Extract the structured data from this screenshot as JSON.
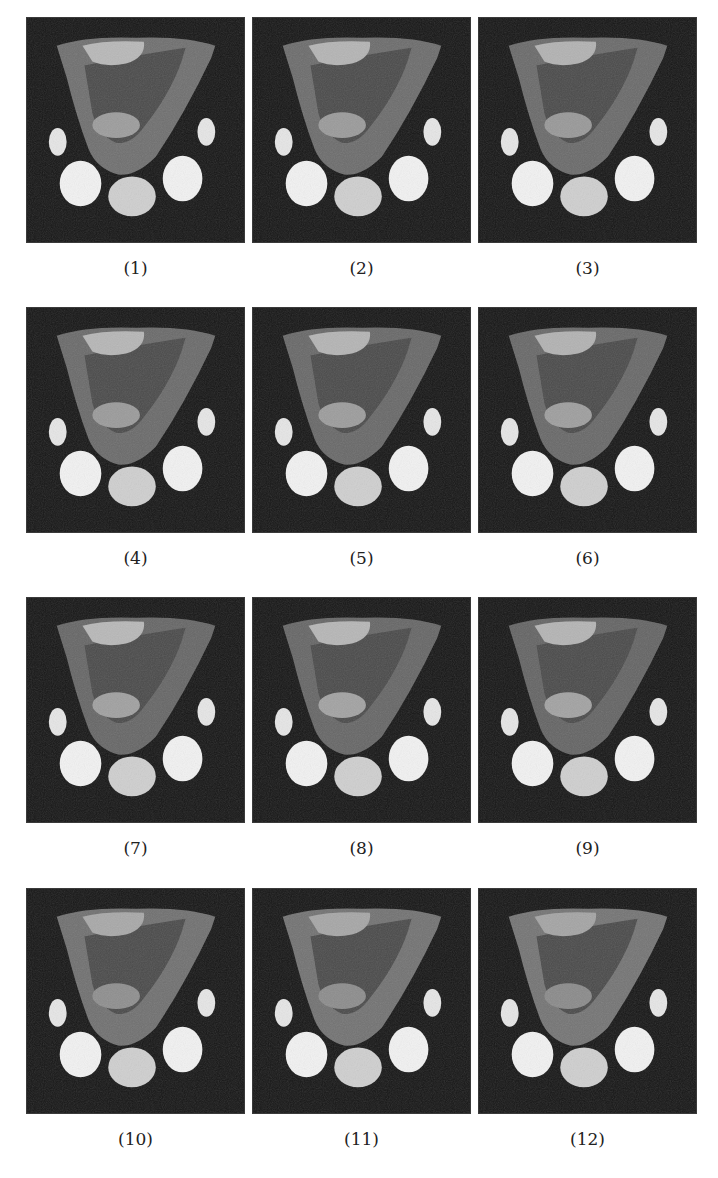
{
  "figure": {
    "layout": {
      "columns": 3,
      "rows": 4
    },
    "panels": [
      {
        "label": "(1)",
        "tissue_tone": "#6f6f6f",
        "upper_tone": "#b8b8b8",
        "lower_tone": "#9c9c9c"
      },
      {
        "label": "(2)",
        "tissue_tone": "#6c6c6c",
        "upper_tone": "#b4b4b4",
        "lower_tone": "#9a9a9a"
      },
      {
        "label": "(3)",
        "tissue_tone": "#6a6a6a",
        "upper_tone": "#b2b2b2",
        "lower_tone": "#989898"
      },
      {
        "label": "(4)",
        "tissue_tone": "#6a6a6a",
        "upper_tone": "#b6b6b6",
        "lower_tone": "#9a9a9a"
      },
      {
        "label": "(5)",
        "tissue_tone": "#686868",
        "upper_tone": "#b4b4b4",
        "lower_tone": "#9c9c9c"
      },
      {
        "label": "(6)",
        "tissue_tone": "#686868",
        "upper_tone": "#b2b2b2",
        "lower_tone": "#9e9e9e"
      },
      {
        "label": "(7)",
        "tissue_tone": "#666666",
        "upper_tone": "#b8b8b8",
        "lower_tone": "#a0a0a0"
      },
      {
        "label": "(8)",
        "tissue_tone": "#666666",
        "upper_tone": "#b6b6b6",
        "lower_tone": "#a2a2a2"
      },
      {
        "label": "(9)",
        "tissue_tone": "#646464",
        "upper_tone": "#b4b4b4",
        "lower_tone": "#a2a2a2"
      },
      {
        "label": "(10)",
        "tissue_tone": "#707070",
        "upper_tone": "#a8a8a8",
        "lower_tone": "#8e8e8e"
      },
      {
        "label": "(11)",
        "tissue_tone": "#727272",
        "upper_tone": "#a6a6a6",
        "lower_tone": "#8c8c8c"
      },
      {
        "label": "(12)",
        "tissue_tone": "#747474",
        "upper_tone": "#a4a4a4",
        "lower_tone": "#8a8a8a"
      }
    ],
    "colors": {
      "background": "#161616",
      "vial_bright": "#f2f2f2",
      "vial_mid": "#cfcfcf",
      "vial_small": "#e6e6e6",
      "caption_text": "#222222"
    }
  }
}
